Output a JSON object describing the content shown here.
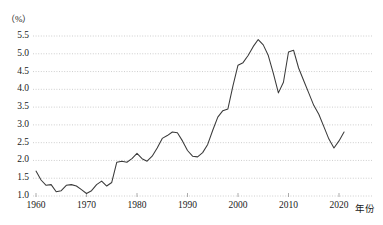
{
  "chart_data": {
    "type": "line",
    "title": "",
    "xlabel": "年份",
    "ylabel": "（%）",
    "unit_label": "（%）",
    "xlim": [
      1959,
      2022
    ],
    "ylim": [
      1.0,
      5.5
    ],
    "grid": true,
    "legend": "none",
    "y_ticks": [
      "1.0",
      "1.5",
      "2.0",
      "2.5",
      "3.0",
      "3.5",
      "4.0",
      "4.5",
      "5.0",
      "5.5"
    ],
    "y_tick_values": [
      1.0,
      1.5,
      2.0,
      2.5,
      3.0,
      3.5,
      4.0,
      4.5,
      5.0,
      5.5
    ],
    "x_ticks": [
      "1960",
      "1970",
      "1980",
      "1990",
      "2000",
      "2010",
      "2020"
    ],
    "x_tick_values": [
      1960,
      1970,
      1980,
      1990,
      2000,
      2010,
      2020
    ],
    "series": [
      {
        "name": "ratio",
        "color": "#3a3a3a",
        "x": [
          1960,
          1961,
          1962,
          1963,
          1964,
          1965,
          1966,
          1967,
          1968,
          1969,
          1970,
          1971,
          1972,
          1973,
          1974,
          1975,
          1976,
          1977,
          1978,
          1979,
          1980,
          1981,
          1982,
          1983,
          1984,
          1985,
          1986,
          1987,
          1988,
          1989,
          1990,
          1991,
          1992,
          1993,
          1994,
          1995,
          1996,
          1997,
          1998,
          1999,
          2000,
          2001,
          2002,
          2003,
          2004,
          2005,
          2006,
          2007,
          2008,
          2009,
          2010,
          2011,
          2012,
          2013,
          2014,
          2015,
          2016,
          2017,
          2018,
          2019,
          2020,
          2021
        ],
        "values": [
          1.7,
          1.45,
          1.3,
          1.32,
          1.12,
          1.15,
          1.3,
          1.32,
          1.28,
          1.18,
          1.07,
          1.15,
          1.32,
          1.42,
          1.28,
          1.38,
          1.95,
          1.98,
          1.95,
          2.05,
          2.2,
          2.05,
          1.98,
          2.12,
          2.35,
          2.62,
          2.7,
          2.8,
          2.78,
          2.55,
          2.28,
          2.12,
          2.1,
          2.22,
          2.45,
          2.85,
          3.22,
          3.4,
          3.45,
          4.1,
          4.68,
          4.75,
          4.95,
          5.2,
          5.4,
          5.25,
          4.95,
          4.45,
          3.9,
          4.2,
          5.05,
          5.1,
          4.6,
          4.25,
          3.9,
          3.55,
          3.3,
          2.95,
          2.6,
          2.35,
          2.55,
          2.8
        ]
      }
    ]
  },
  "axes": {
    "y_unit": "（%）",
    "x_name": "年份"
  }
}
